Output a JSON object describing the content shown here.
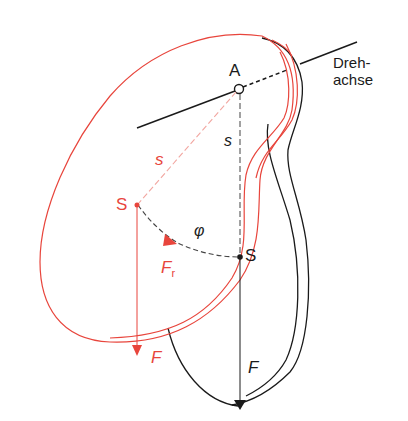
{
  "diagram": {
    "title": "",
    "colors": {
      "black": "#1a1a1a",
      "red": "#e8453c",
      "red_light": "#f2a6a0",
      "background": "#ffffff"
    },
    "labels": {
      "pivot": "A",
      "axis_line1": "Dreh-",
      "axis_line2": "achse",
      "distance_black": "s",
      "distance_red": "s",
      "center_red": "S",
      "center_black": "S",
      "angle": "φ",
      "restoring_force": "F",
      "restoring_force_sub": "r",
      "weight_red": "F",
      "weight_black": "F"
    }
  }
}
